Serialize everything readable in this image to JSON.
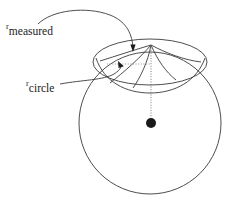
{
  "figure": {
    "background_color": "#ffffff",
    "stroke_color": "#3a3a3a",
    "dot_color": "#1a1a1a",
    "width": 238,
    "height": 198
  },
  "labels": {
    "measured": {
      "base": "r",
      "subscript": "measured",
      "full": "r_measured"
    },
    "circle": {
      "base": "r",
      "subscript": "circle",
      "full": "r_circle"
    }
  },
  "geometry": {
    "sphere": {
      "cx": 150,
      "cy": 123,
      "r": 71
    },
    "pole": {
      "x": 151,
      "y": 45
    },
    "center_dot": {
      "cx": 151,
      "cy": 123,
      "r": 5
    },
    "cap_ellipse": {
      "cx": 150,
      "cy": 62,
      "rx": 57,
      "ry": 23
    },
    "r_circle_line": {
      "x1": 107,
      "y1": 64,
      "x2": 151,
      "y2": 64
    },
    "axis_line": {
      "x1": 151,
      "y1": 45,
      "x2": 151,
      "y2": 118
    }
  }
}
